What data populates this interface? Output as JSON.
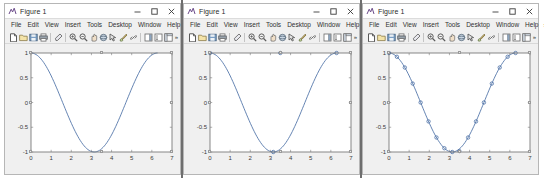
{
  "window": {
    "title": "Figure 1",
    "app_icon": "matlab-figure-icon",
    "buttons": {
      "minimize": "–",
      "maximize": "□",
      "close": "×"
    }
  },
  "menubar": {
    "items": [
      {
        "label": "File"
      },
      {
        "label": "Edit"
      },
      {
        "label": "View"
      },
      {
        "label": "Insert"
      },
      {
        "label": "Tools"
      },
      {
        "label": "Desktop"
      },
      {
        "label": "Window"
      },
      {
        "label": "Help"
      }
    ],
    "overflow": "»"
  },
  "toolbar": {
    "overflow": "»",
    "items": [
      {
        "name": "new-figure-icon",
        "tip": "New Figure"
      },
      {
        "name": "open-file-icon",
        "tip": "Open File"
      },
      {
        "name": "save-figure-icon",
        "tip": "Save Figure"
      },
      {
        "name": "print-figure-icon",
        "tip": "Print Figure"
      },
      {
        "name": "separator-1",
        "tip": ""
      },
      {
        "name": "edit-plot-icon",
        "tip": "Edit Plot"
      },
      {
        "name": "separator-2",
        "tip": ""
      },
      {
        "name": "zoom-in-icon",
        "tip": "Zoom In"
      },
      {
        "name": "zoom-out-icon",
        "tip": "Zoom Out"
      },
      {
        "name": "pan-icon",
        "tip": "Pan"
      },
      {
        "name": "rotate-3d-icon",
        "tip": "Rotate 3D"
      },
      {
        "name": "data-cursor-icon",
        "tip": "Data Cursor"
      },
      {
        "name": "brush-icon",
        "tip": "Brush/Select Data"
      },
      {
        "name": "link-plot-icon",
        "tip": "Link Plot"
      },
      {
        "name": "separator-3",
        "tip": ""
      },
      {
        "name": "insert-colorbar-icon",
        "tip": "Insert Colorbar"
      },
      {
        "name": "insert-legend-icon",
        "tip": "Insert Legend"
      },
      {
        "name": "show-plot-tools-icon",
        "tip": "Show Plot Tools"
      }
    ]
  },
  "figures": [
    {
      "id": "figure-left",
      "title": "Figure 1",
      "marker_style": "none"
    },
    {
      "id": "figure-middle",
      "title": "Figure 1",
      "marker_style": "sparse"
    },
    {
      "id": "figure-right",
      "title": "Figure 1",
      "marker_style": "dense"
    }
  ],
  "chart_data": [
    {
      "type": "line",
      "title": "",
      "xlabel": "",
      "ylabel": "",
      "xlim": [
        0,
        7
      ],
      "ylim": [
        -1,
        1
      ],
      "xticks": [
        0,
        1,
        2,
        3,
        4,
        5,
        6,
        7
      ],
      "yticks": [
        -1,
        -0.5,
        0,
        0.5,
        1
      ],
      "xticklabels": [
        "0",
        "1",
        "2",
        "3",
        "4",
        "5",
        "6",
        "7"
      ],
      "yticklabels": [
        "-1",
        "-0.5",
        "0",
        "0.5",
        "1"
      ],
      "grid": false,
      "legend": false,
      "line_color": "#4a6fa5",
      "marker": "none",
      "series": [
        {
          "name": "cos(x)",
          "x": [
            0,
            0.0628,
            0.1257,
            0.1885,
            0.2513,
            0.3142,
            0.377,
            0.4398,
            0.5027,
            0.5655,
            0.6283,
            0.6912,
            0.754,
            0.8168,
            0.8796,
            0.9425,
            1.0053,
            1.0681,
            1.131,
            1.1938,
            1.2566,
            1.3195,
            1.3823,
            1.4451,
            1.508,
            1.5708,
            1.6336,
            1.6965,
            1.7593,
            1.8221,
            1.885,
            1.9478,
            2.0106,
            2.0735,
            2.1363,
            2.1991,
            2.2619,
            2.3248,
            2.3876,
            2.4504,
            2.5133,
            2.5761,
            2.6389,
            2.7018,
            2.7646,
            2.8274,
            2.8903,
            2.9531,
            3.0159,
            3.0788,
            3.1416,
            3.2044,
            3.2673,
            3.3301,
            3.3929,
            3.4558,
            3.5186,
            3.5814,
            3.6442,
            3.7071,
            3.7699,
            3.8327,
            3.8956,
            3.9584,
            4.0212,
            4.0841,
            4.1469,
            4.2097,
            4.2726,
            4.3354,
            4.3982,
            4.4611,
            4.5239,
            4.5867,
            4.6496,
            4.7124,
            4.7752,
            4.838,
            4.9009,
            4.9637,
            5.0265,
            5.0894,
            5.1522,
            5.215,
            5.2779,
            5.3407,
            5.4035,
            5.4664,
            5.5292,
            5.592,
            5.6549,
            5.7177,
            5.7805,
            5.8434,
            5.9062,
            5.969,
            6.0319,
            6.0947,
            6.1575,
            6.2204,
            6.2832
          ],
          "y": [
            1.0,
            0.998,
            0.9921,
            0.9823,
            0.9686,
            0.9511,
            0.9298,
            0.9048,
            0.8763,
            0.8443,
            0.809,
            0.7705,
            0.729,
            0.6845,
            0.6374,
            0.5878,
            0.5358,
            0.4818,
            0.4258,
            0.3681,
            0.309,
            0.2487,
            0.1874,
            0.1253,
            0.0628,
            0.0,
            -0.0628,
            -0.1253,
            -0.1874,
            -0.2487,
            -0.309,
            -0.3681,
            -0.4258,
            -0.4818,
            -0.5358,
            -0.5878,
            -0.6374,
            -0.6845,
            -0.729,
            -0.7705,
            -0.809,
            -0.8443,
            -0.8763,
            -0.9048,
            -0.9298,
            -0.9511,
            -0.9686,
            -0.9823,
            -0.9921,
            -0.998,
            -1.0,
            -0.998,
            -0.9921,
            -0.9823,
            -0.9686,
            -0.9511,
            -0.9298,
            -0.9048,
            -0.8763,
            -0.8443,
            -0.809,
            -0.7705,
            -0.729,
            -0.6845,
            -0.6374,
            -0.5878,
            -0.5358,
            -0.4818,
            -0.4258,
            -0.3681,
            -0.309,
            -0.2487,
            -0.1874,
            -0.1253,
            -0.0628,
            0.0,
            0.0628,
            0.1253,
            0.1874,
            0.2487,
            0.309,
            0.3681,
            0.4258,
            0.4818,
            0.5358,
            0.5878,
            0.6374,
            0.6845,
            0.729,
            0.7705,
            0.809,
            0.8443,
            0.8763,
            0.9048,
            0.9298,
            0.9511,
            0.9686,
            0.9823,
            0.9921,
            0.998,
            1.0
          ]
        }
      ]
    },
    {
      "type": "line",
      "title": "",
      "xlabel": "",
      "ylabel": "",
      "xlim": [
        0,
        7
      ],
      "ylim": [
        -1,
        1
      ],
      "xticks": [
        0,
        1,
        2,
        3,
        4,
        5,
        6,
        7
      ],
      "yticks": [
        -1,
        -0.5,
        0,
        0.5,
        1
      ],
      "xticklabels": [
        "0",
        "1",
        "2",
        "3",
        "4",
        "5",
        "6",
        "7"
      ],
      "yticklabels": [
        "-1",
        "-0.5",
        "0",
        "0.5",
        "1"
      ],
      "grid": false,
      "legend": false,
      "line_color": "#4a6fa5",
      "marker": "o",
      "marker_x": [
        0,
        3.1416,
        3.4907,
        6.2832
      ],
      "marker_y": [
        1.0,
        -1.0,
        1.0,
        1.0
      ],
      "series": [
        {
          "name": "cos(x) with sparse markers",
          "x": [
            0,
            0.0628,
            0.1257,
            0.1885,
            0.2513,
            0.3142,
            0.377,
            0.4398,
            0.5027,
            0.5655,
            0.6283,
            0.6912,
            0.754,
            0.8168,
            0.8796,
            0.9425,
            1.0053,
            1.0681,
            1.131,
            1.1938,
            1.2566,
            1.3195,
            1.3823,
            1.4451,
            1.508,
            1.5708,
            1.6336,
            1.6965,
            1.7593,
            1.8221,
            1.885,
            1.9478,
            2.0106,
            2.0735,
            2.1363,
            2.1991,
            2.2619,
            2.3248,
            2.3876,
            2.4504,
            2.5133,
            2.5761,
            2.6389,
            2.7018,
            2.7646,
            2.8274,
            2.8903,
            2.9531,
            3.0159,
            3.0788,
            3.1416,
            3.2044,
            3.2673,
            3.3301,
            3.3929,
            3.4558,
            3.5186,
            3.5814,
            3.6442,
            3.7071,
            3.7699,
            3.8327,
            3.8956,
            3.9584,
            4.0212,
            4.0841,
            4.1469,
            4.2097,
            4.2726,
            4.3354,
            4.3982,
            4.4611,
            4.5239,
            4.5867,
            4.6496,
            4.7124,
            4.7752,
            4.838,
            4.9009,
            4.9637,
            5.0265,
            5.0894,
            5.1522,
            5.215,
            5.2779,
            5.3407,
            5.4035,
            5.4664,
            5.5292,
            5.592,
            5.6549,
            5.7177,
            5.7805,
            5.8434,
            5.9062,
            5.969,
            6.0319,
            6.0947,
            6.1575,
            6.2204,
            6.2832
          ],
          "y": [
            1.0,
            0.998,
            0.9921,
            0.9823,
            0.9686,
            0.9511,
            0.9298,
            0.9048,
            0.8763,
            0.8443,
            0.809,
            0.7705,
            0.729,
            0.6845,
            0.6374,
            0.5878,
            0.5358,
            0.4818,
            0.4258,
            0.3681,
            0.309,
            0.2487,
            0.1874,
            0.1253,
            0.0628,
            0.0,
            -0.0628,
            -0.1253,
            -0.1874,
            -0.2487,
            -0.309,
            -0.3681,
            -0.4258,
            -0.4818,
            -0.5358,
            -0.5878,
            -0.6374,
            -0.6845,
            -0.729,
            -0.7705,
            -0.809,
            -0.8443,
            -0.8763,
            -0.9048,
            -0.9298,
            -0.9511,
            -0.9686,
            -0.9823,
            -0.9921,
            -0.998,
            -1.0,
            -0.998,
            -0.9921,
            -0.9823,
            -0.9686,
            -0.9511,
            -0.9298,
            -0.9048,
            -0.8763,
            -0.8443,
            -0.809,
            -0.7705,
            -0.729,
            -0.6845,
            -0.6374,
            -0.5878,
            -0.5358,
            -0.4818,
            -0.4258,
            -0.3681,
            -0.309,
            -0.2487,
            -0.1874,
            -0.1253,
            -0.0628,
            0.0,
            0.0628,
            0.1253,
            0.1874,
            0.2487,
            0.309,
            0.3681,
            0.4258,
            0.4818,
            0.5358,
            0.5878,
            0.6374,
            0.6845,
            0.729,
            0.7705,
            0.809,
            0.8443,
            0.8763,
            0.9048,
            0.9298,
            0.9511,
            0.9686,
            0.9823,
            0.9921,
            0.998,
            1.0
          ]
        }
      ]
    },
    {
      "type": "line",
      "title": "",
      "xlabel": "",
      "ylabel": "",
      "xlim": [
        0,
        7
      ],
      "ylim": [
        -1,
        1
      ],
      "xticks": [
        0,
        1,
        2,
        3,
        4,
        5,
        6,
        7
      ],
      "yticks": [
        -1,
        -0.5,
        0,
        0.5,
        1
      ],
      "xticklabels": [
        "0",
        "1",
        "2",
        "3",
        "4",
        "5",
        "6",
        "7"
      ],
      "yticklabels": [
        "-1",
        "-0.5",
        "0",
        "0.5",
        "1"
      ],
      "grid": false,
      "legend": false,
      "line_color": "#4a6fa5",
      "marker": "o",
      "marker_x": [
        0,
        0.3927,
        0.7854,
        1.1781,
        1.5708,
        1.9635,
        2.3562,
        2.7489,
        3.1416,
        3.4907,
        3.927,
        4.3197,
        4.7124,
        5.1051,
        5.4978,
        5.8905,
        6.2832
      ],
      "marker_y": [
        1.0,
        0.9239,
        0.7071,
        0.3827,
        0.0,
        -0.3827,
        -0.7071,
        -0.9239,
        -1.0,
        -0.9808,
        -0.7071,
        -0.3827,
        0.0,
        0.3827,
        0.7071,
        0.9239,
        1.0
      ],
      "series": [
        {
          "name": "cos(x) with dense markers",
          "x": [
            0,
            0.0628,
            0.1257,
            0.1885,
            0.2513,
            0.3142,
            0.377,
            0.4398,
            0.5027,
            0.5655,
            0.6283,
            0.6912,
            0.754,
            0.8168,
            0.8796,
            0.9425,
            1.0053,
            1.0681,
            1.131,
            1.1938,
            1.2566,
            1.3195,
            1.3823,
            1.4451,
            1.508,
            1.5708,
            1.6336,
            1.6965,
            1.7593,
            1.8221,
            1.885,
            1.9478,
            2.0106,
            2.0735,
            2.1363,
            2.1991,
            2.2619,
            2.3248,
            2.3876,
            2.4504,
            2.5133,
            2.5761,
            2.6389,
            2.7018,
            2.7646,
            2.8274,
            2.8903,
            2.9531,
            3.0159,
            3.0788,
            3.1416,
            3.2044,
            3.2673,
            3.3301,
            3.3929,
            3.4558,
            3.5186,
            3.5814,
            3.6442,
            3.7071,
            3.7699,
            3.8327,
            3.8956,
            3.9584,
            4.0212,
            4.0841,
            4.1469,
            4.2097,
            4.2726,
            4.3354,
            4.3982,
            4.4611,
            4.5239,
            4.5867,
            4.6496,
            4.7124,
            4.7752,
            4.838,
            4.9009,
            4.9637,
            5.0265,
            5.0894,
            5.1522,
            5.215,
            5.2779,
            5.3407,
            5.4035,
            5.4664,
            5.5292,
            5.592,
            5.6549,
            5.7177,
            5.7805,
            5.8434,
            5.9062,
            5.969,
            6.0319,
            6.0947,
            6.1575,
            6.2204,
            6.2832
          ],
          "y": [
            1.0,
            0.998,
            0.9921,
            0.9823,
            0.9686,
            0.9511,
            0.9298,
            0.9048,
            0.8763,
            0.8443,
            0.809,
            0.7705,
            0.729,
            0.6845,
            0.6374,
            0.5878,
            0.5358,
            0.4818,
            0.4258,
            0.3681,
            0.309,
            0.2487,
            0.1874,
            0.1253,
            0.0628,
            0.0,
            -0.0628,
            -0.1253,
            -0.1874,
            -0.2487,
            -0.309,
            -0.3681,
            -0.4258,
            -0.4818,
            -0.5358,
            -0.5878,
            -0.6374,
            -0.6845,
            -0.729,
            -0.7705,
            -0.809,
            -0.8443,
            -0.8763,
            -0.9048,
            -0.9298,
            -0.9511,
            -0.9686,
            -0.9823,
            -0.9921,
            -0.998,
            -1.0,
            -0.998,
            -0.9921,
            -0.9823,
            -0.9686,
            -0.9511,
            -0.9298,
            -0.9048,
            -0.8763,
            -0.8443,
            -0.809,
            -0.7705,
            -0.729,
            -0.6845,
            -0.6374,
            -0.5878,
            -0.5358,
            -0.4818,
            -0.4258,
            -0.3681,
            -0.309,
            -0.2487,
            -0.1874,
            -0.1253,
            -0.0628,
            0.0,
            0.0628,
            0.1253,
            0.1874,
            0.2487,
            0.309,
            0.3681,
            0.4258,
            0.4818,
            0.5358,
            0.5878,
            0.6374,
            0.6845,
            0.729,
            0.7705,
            0.809,
            0.8443,
            0.8763,
            0.9048,
            0.9298,
            0.9511,
            0.9686,
            0.9823,
            0.9921,
            0.998,
            1.0
          ]
        }
      ]
    }
  ],
  "colors": {
    "window_bg": "#f0f0f0",
    "titlebar_bg": "#ffffff",
    "axes_bg": "#ffffff",
    "axes_line": "#7a7a7a",
    "plot_line": "#4a6fa5",
    "tick_text": "#3a3a3a",
    "desktop_bg": "#ffffff",
    "divider": "#6e6e6e"
  }
}
